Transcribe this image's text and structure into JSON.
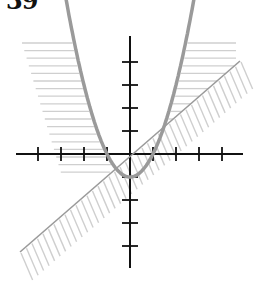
{
  "problem": {
    "number": "39"
  },
  "graph": {
    "origin_px": {
      "x": 130,
      "y": 154
    },
    "unit_px": 23,
    "x_axis": {
      "from_px": 16,
      "to_px": 243,
      "ticks": [
        -4,
        -3,
        -2,
        -1,
        1,
        2,
        3,
        4
      ]
    },
    "y_axis": {
      "from_px": 36,
      "to_px": 268,
      "ticks": [
        -4,
        -3,
        -2,
        -1,
        1,
        2,
        3,
        4
      ]
    },
    "curves": [
      {
        "name": "parabola",
        "equation": "y = x^2 - 1",
        "style": "thick",
        "color": "#999999",
        "x_range": [
          -2.85,
          2.85
        ]
      },
      {
        "name": "line",
        "equation": "y = 0.87x",
        "style": "thin",
        "color": "#999999",
        "endpoints_px": [
          [
            20,
            252
          ],
          [
            240,
            61
          ]
        ]
      }
    ],
    "shading": [
      {
        "region": "outside parabola, left",
        "pattern": "horizontal-hatch",
        "color": "#cccccc"
      },
      {
        "region": "outside parabola, right, above line",
        "pattern": "horizontal-hatch",
        "color": "#cccccc"
      },
      {
        "region": "below-right of line",
        "pattern": "diagonal-hatch",
        "color": "#cccccc"
      }
    ],
    "colors": {
      "axis": "#111111",
      "curve": "#9a9a9a",
      "hatch": "#cfcfcf"
    }
  }
}
